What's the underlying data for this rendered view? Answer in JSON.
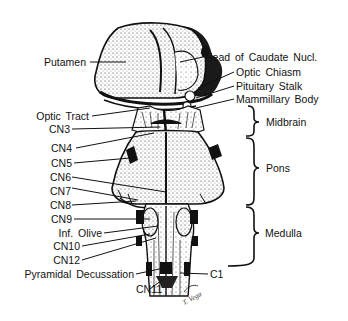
{
  "diagram": {
    "left_labels": [
      {
        "id": "putamen",
        "text": "Putamen"
      },
      {
        "id": "optic-tract",
        "text": "Optic Tract"
      },
      {
        "id": "cn3",
        "text": "CN3"
      },
      {
        "id": "cn4",
        "text": "CN4"
      },
      {
        "id": "cn5",
        "text": "CN5"
      },
      {
        "id": "cn6",
        "text": "CN6"
      },
      {
        "id": "cn7",
        "text": "CN7"
      },
      {
        "id": "cn8",
        "text": "CN8"
      },
      {
        "id": "cn9",
        "text": "CN9"
      },
      {
        "id": "inf-olive",
        "text": "Inf. Olive"
      },
      {
        "id": "cn10",
        "text": "CN10"
      },
      {
        "id": "cn12",
        "text": "CN12"
      },
      {
        "id": "pyramidal-decussation",
        "text": "Pyramidal Decussation"
      },
      {
        "id": "cn11",
        "text": "CN11"
      }
    ],
    "right_labels": [
      {
        "id": "head-of-caudate",
        "text": "Head of Caudate Nucl."
      },
      {
        "id": "optic-chiasm",
        "text": "Optic Chiasm"
      },
      {
        "id": "pituitary-stalk",
        "text": "Pituitary Stalk"
      },
      {
        "id": "mammillary-body",
        "text": "Mammillary Body"
      },
      {
        "id": "c1",
        "text": "C1"
      }
    ],
    "regions": [
      {
        "id": "midbrain",
        "text": "Midbrain"
      },
      {
        "id": "pons",
        "text": "Pons"
      },
      {
        "id": "medulla",
        "text": "Medulla"
      }
    ],
    "signature": "T. Vega"
  }
}
